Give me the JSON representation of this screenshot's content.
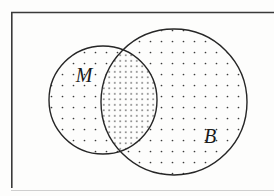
{
  "figure": {
    "kind": "venn-diagram",
    "caption": "",
    "background_color": "#fdfdfc",
    "ink_color": "#262626"
  },
  "frame": {
    "name": "page-frame",
    "border_color": "#3a3a3a",
    "left_x": 11,
    "top_y": 12,
    "left_bottom_y": 188,
    "right_x": 274,
    "stroke_width": 1.6
  },
  "sets": [
    {
      "id": "M",
      "label": "M",
      "label_x": 84,
      "label_y": 82,
      "label_size": 20,
      "cx": 103,
      "cy": 100,
      "r": 54,
      "stroke": "#262626",
      "stroke_width": 1.4,
      "fill_pattern": "dots-sparse"
    },
    {
      "id": "B",
      "label": "B",
      "label_x": 210,
      "label_y": 143,
      "label_size": 20,
      "cx": 174,
      "cy": 102,
      "r": 73,
      "stroke": "#262626",
      "stroke_width": 1.4,
      "fill_pattern": "dots-sparse"
    }
  ],
  "intersection": {
    "name": "M-intersect-B",
    "fill_pattern": "dots-dense",
    "label": ""
  },
  "patterns": {
    "dots_sparse": {
      "spacing": 11,
      "dot_radius": 0.85,
      "color": "#3a3a3a"
    },
    "dots_dense": {
      "spacing": 5.5,
      "dot_radius": 0.8,
      "color": "#3a3a3a"
    }
  }
}
